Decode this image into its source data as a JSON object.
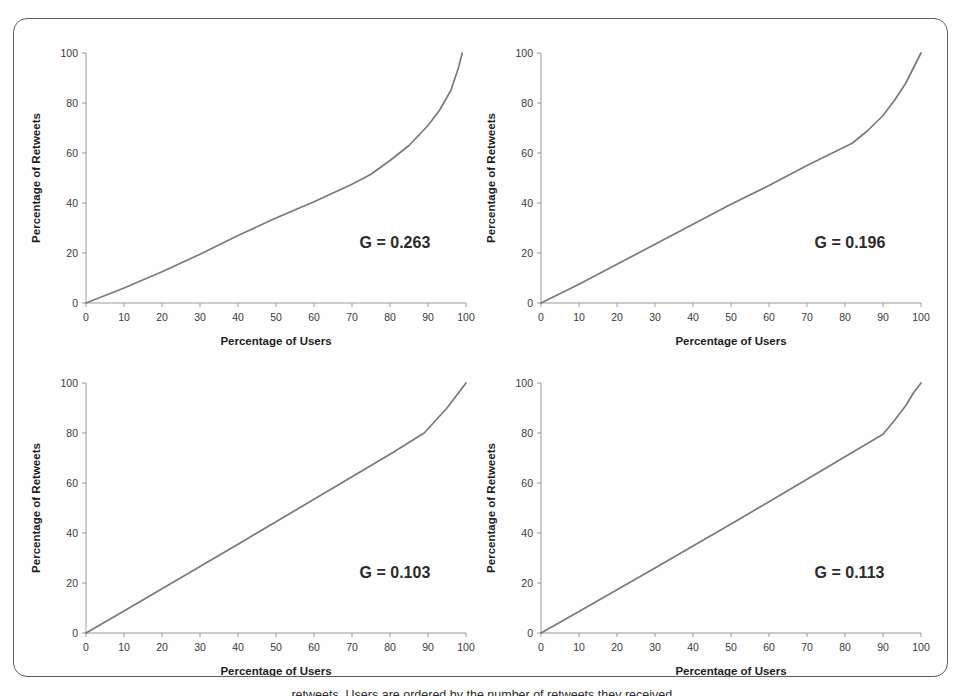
{
  "figure": {
    "panel_count": 4,
    "border_color": "#5e5e5e",
    "curve_color": "#7a7a7a",
    "axis_color": "#9a9a9a",
    "caption_partial": "retweets. Users are ordered by the number of retweets they received."
  },
  "chart_data": [
    {
      "type": "line",
      "id": "panel-a",
      "title": "",
      "xlabel": "Percentage of Users",
      "ylabel": "Percentage of Retweets",
      "xlim": [
        0,
        100
      ],
      "ylim": [
        0,
        100
      ],
      "xticks": [
        0,
        10,
        20,
        30,
        40,
        50,
        60,
        70,
        80,
        90,
        100
      ],
      "yticks": [
        0,
        20,
        40,
        60,
        80,
        100
      ],
      "grid": false,
      "legend": "none",
      "annotation": "G = 0.263",
      "gini": 0.263,
      "series": [
        {
          "name": "Lorenz curve",
          "x": [
            0,
            10,
            20,
            30,
            40,
            50,
            60,
            70,
            75,
            80,
            85,
            90,
            93,
            96,
            98,
            99
          ],
          "y": [
            0,
            6,
            12.5,
            19.5,
            27,
            34,
            40.5,
            47.5,
            51.5,
            57,
            63,
            71,
            77,
            85,
            94,
            100
          ]
        }
      ]
    },
    {
      "type": "line",
      "id": "panel-b",
      "title": "",
      "xlabel": "Percentage of Users",
      "ylabel": "Percentage of Retweets",
      "xlim": [
        0,
        100
      ],
      "ylim": [
        0,
        100
      ],
      "xticks": [
        0,
        10,
        20,
        30,
        40,
        50,
        60,
        70,
        80,
        90,
        100
      ],
      "yticks": [
        0,
        20,
        40,
        60,
        80,
        100
      ],
      "grid": false,
      "legend": "none",
      "annotation": "G = 0.196",
      "gini": 0.196,
      "series": [
        {
          "name": "Lorenz curve",
          "x": [
            0,
            10,
            20,
            30,
            40,
            50,
            60,
            70,
            80,
            82,
            86,
            90,
            93,
            96,
            98,
            100
          ],
          "y": [
            0,
            7.5,
            15.5,
            23.5,
            31.5,
            39.5,
            47,
            55,
            62.5,
            64,
            69,
            75,
            81,
            88,
            94,
            100
          ]
        }
      ]
    },
    {
      "type": "line",
      "id": "panel-c",
      "title": "",
      "xlabel": "Percentage of Users",
      "ylabel": "Percentage of Retweets",
      "xlim": [
        0,
        100
      ],
      "ylim": [
        0,
        100
      ],
      "xticks": [
        0,
        10,
        20,
        30,
        40,
        50,
        60,
        70,
        80,
        90,
        100
      ],
      "yticks": [
        0,
        20,
        40,
        60,
        80,
        100
      ],
      "grid": false,
      "legend": "none",
      "annotation": "G = 0.103",
      "gini": 0.103,
      "series": [
        {
          "name": "Lorenz curve",
          "x": [
            0,
            10,
            20,
            30,
            40,
            50,
            60,
            70,
            80,
            89,
            92,
            95,
            100
          ],
          "y": [
            0,
            8.8,
            17.7,
            26.6,
            35.5,
            44.5,
            53.5,
            62.5,
            71.5,
            80,
            85,
            90,
            100
          ]
        }
      ]
    },
    {
      "type": "line",
      "id": "panel-d",
      "title": "",
      "xlabel": "Percentage of Users",
      "ylabel": "Percentage of Retweets",
      "xlim": [
        0,
        100
      ],
      "ylim": [
        0,
        100
      ],
      "xticks": [
        0,
        10,
        20,
        30,
        40,
        50,
        60,
        70,
        80,
        90,
        100
      ],
      "yticks": [
        0,
        20,
        40,
        60,
        80,
        100
      ],
      "grid": false,
      "legend": "none",
      "annotation": "G = 0.113",
      "gini": 0.113,
      "series": [
        {
          "name": "Lorenz curve",
          "x": [
            0,
            10,
            20,
            30,
            40,
            50,
            60,
            70,
            80,
            90,
            93,
            96,
            98,
            100
          ],
          "y": [
            0,
            8.6,
            17.3,
            26,
            34.8,
            43.6,
            52.5,
            61.5,
            70.5,
            79.5,
            85,
            91,
            96,
            100
          ]
        }
      ]
    }
  ]
}
